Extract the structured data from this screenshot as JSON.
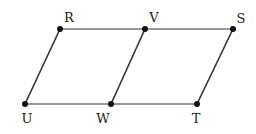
{
  "diagram": {
    "type": "geometry",
    "colors": {
      "line": "#333333",
      "point": "#111111",
      "label": "#222222"
    },
    "points": [
      {
        "id": "R",
        "label": "R",
        "x": 60,
        "y": 29,
        "lx": 69,
        "ly": 22
      },
      {
        "id": "V",
        "label": "V",
        "x": 145,
        "y": 29,
        "lx": 154,
        "ly": 22
      },
      {
        "id": "S",
        "label": "S",
        "x": 233,
        "y": 29,
        "lx": 241,
        "ly": 23
      },
      {
        "id": "U",
        "label": "U",
        "x": 25,
        "y": 104,
        "lx": 27,
        "ly": 123
      },
      {
        "id": "W",
        "label": "W",
        "x": 111,
        "y": 104,
        "lx": 103,
        "ly": 123
      },
      {
        "id": "T",
        "label": "T",
        "x": 197,
        "y": 104,
        "lx": 196,
        "ly": 123
      }
    ],
    "segments": [
      {
        "from": "R",
        "to": "S",
        "w": 1
      },
      {
        "from": "U",
        "to": "T",
        "w": 1
      },
      {
        "from": "U",
        "to": "R",
        "w": 1.6
      },
      {
        "from": "W",
        "to": "V",
        "w": 1.6
      },
      {
        "from": "T",
        "to": "S",
        "w": 1.6
      }
    ]
  }
}
